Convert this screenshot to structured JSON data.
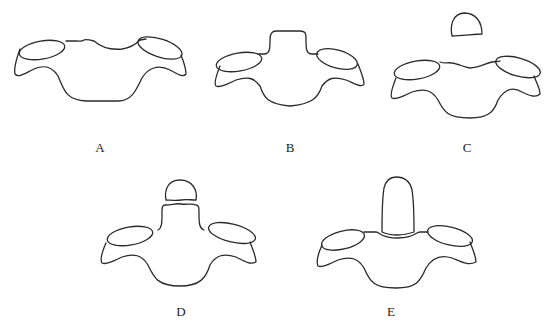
{
  "figure": {
    "panels": [
      {
        "id": "A",
        "label": "A",
        "description": "Vertebra outline with shallow superior concavity, no odontoid process"
      },
      {
        "id": "B",
        "label": "B",
        "description": "Vertebra outline with small raised central prominence"
      },
      {
        "id": "C",
        "label": "C",
        "description": "Vertebra outline with separate detached rounded ossicle above"
      },
      {
        "id": "D",
        "label": "D",
        "description": "Vertebra with central column and separated rounded tip (jagged gap)"
      },
      {
        "id": "E",
        "label": "E",
        "description": "Vertebra with tall fused dens-like process and jagged base line"
      }
    ]
  }
}
